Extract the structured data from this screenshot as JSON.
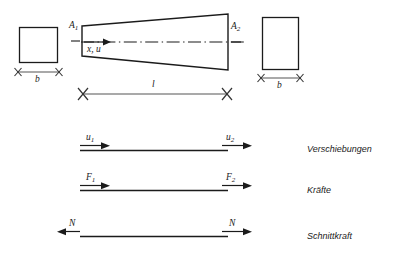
{
  "figure": {
    "title_text": "",
    "stroke_color": "#1b1b1b",
    "dim_color": "#555555",
    "background": "#ffffff"
  },
  "cross_sections": {
    "left": {
      "area_label": "A",
      "area_sub": "1",
      "width_label": "b"
    },
    "right": {
      "area_label": "A",
      "area_sub": "2",
      "width_label": "b"
    }
  },
  "beam": {
    "axis_label": "x, u",
    "length_label": "l"
  },
  "rows": [
    {
      "name": "displacements",
      "left_symbol": "u",
      "left_sub": "1",
      "right_symbol": "u",
      "right_sub": "2",
      "left_arrow_dir": "right",
      "right_arrow_dir": "right",
      "caption": "Verschiebungen"
    },
    {
      "name": "forces",
      "left_symbol": "F",
      "left_sub": "1",
      "right_symbol": "F",
      "right_sub": "2",
      "left_arrow_dir": "right",
      "right_arrow_dir": "right",
      "caption": "Kräfte"
    },
    {
      "name": "internal-force",
      "left_symbol": "N",
      "left_sub": "",
      "right_symbol": "N",
      "right_sub": "",
      "left_arrow_dir": "left",
      "right_arrow_dir": "right",
      "caption": "Schnittkraft"
    }
  ]
}
